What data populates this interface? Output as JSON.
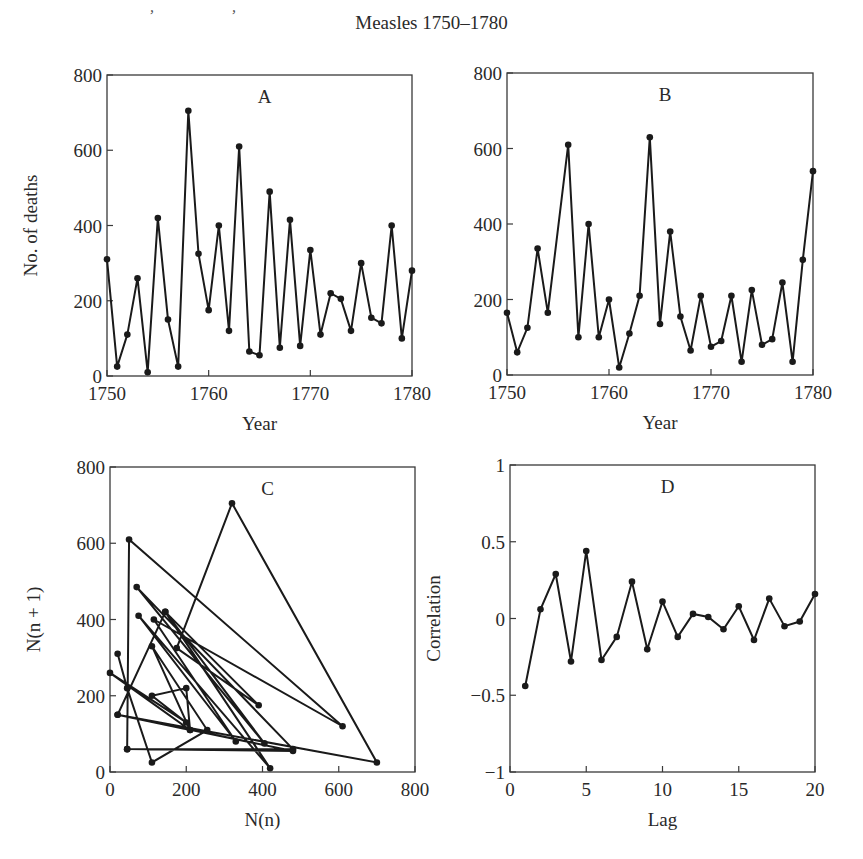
{
  "page": {
    "header_fragments": [
      ",",
      "y",
      ","
    ],
    "figure_title": "Measles 1750–1780"
  },
  "chart_data": [
    {
      "panel": "A",
      "type": "line",
      "title": "A",
      "xlabel": "Year",
      "ylabel": "No. of deaths",
      "xlim": [
        1750,
        1780
      ],
      "ylim": [
        0,
        800
      ],
      "xticks": [
        1750,
        1760,
        1770,
        1780
      ],
      "yticks": [
        0,
        200,
        400,
        600,
        800
      ],
      "x": [
        1750,
        1751,
        1752,
        1753,
        1754,
        1755,
        1756,
        1757,
        1758,
        1759,
        1760,
        1761,
        1762,
        1763,
        1764,
        1765,
        1766,
        1767,
        1768,
        1769,
        1770,
        1771,
        1772,
        1773,
        1774,
        1775,
        1776,
        1777,
        1778,
        1779,
        1780
      ],
      "values": [
        310,
        25,
        110,
        260,
        10,
        420,
        150,
        25,
        705,
        325,
        175,
        400,
        120,
        610,
        65,
        55,
        490,
        75,
        415,
        80,
        335,
        110,
        220,
        205,
        120,
        300,
        155,
        140,
        400,
        100,
        280
      ],
      "markers": true,
      "grid": false
    },
    {
      "panel": "B",
      "type": "line",
      "title": "B",
      "xlabel": "Year",
      "ylabel": "",
      "xlim": [
        1750,
        1780
      ],
      "ylim": [
        0,
        800
      ],
      "xticks": [
        1750,
        1760,
        1770,
        1780
      ],
      "yticks": [
        0,
        200,
        400,
        600,
        800
      ],
      "x": [
        1750,
        1751,
        1752,
        1753,
        1754,
        1756,
        1757,
        1758,
        1759,
        1760,
        1761,
        1762,
        1763,
        1764,
        1765,
        1766,
        1767,
        1768,
        1769,
        1770,
        1771,
        1772,
        1773,
        1774,
        1775,
        1776,
        1777,
        1778,
        1779,
        1780
      ],
      "values": [
        165,
        60,
        125,
        335,
        165,
        610,
        100,
        400,
        100,
        200,
        20,
        110,
        210,
        630,
        135,
        380,
        155,
        65,
        210,
        75,
        90,
        210,
        35,
        225,
        80,
        95,
        245,
        35,
        305,
        540
      ],
      "markers": true,
      "grid": false
    },
    {
      "panel": "C",
      "type": "line",
      "title": "C",
      "xlabel": "N(n)",
      "ylabel": "N(n + 1)",
      "xlim": [
        0,
        800
      ],
      "ylim": [
        0,
        800
      ],
      "xticks": [
        0,
        200,
        400,
        600,
        800
      ],
      "yticks": [
        0,
        200,
        400,
        600,
        800
      ],
      "points": [
        [
          20,
          310
        ],
        [
          45,
          220
        ],
        [
          110,
          25
        ],
        [
          255,
          110
        ],
        [
          110,
          330
        ],
        [
          210,
          110
        ],
        [
          0,
          260
        ],
        [
          200,
          130
        ],
        [
          110,
          200
        ],
        [
          200,
          220
        ],
        [
          210,
          110
        ],
        [
          20,
          150
        ],
        [
          145,
          420
        ],
        [
          390,
          175
        ],
        [
          175,
          325
        ],
        [
          320,
          705
        ],
        [
          700,
          25
        ],
        [
          20,
          150
        ],
        [
          480,
          55
        ],
        [
          45,
          60
        ],
        [
          50,
          610
        ],
        [
          610,
          120
        ],
        [
          115,
          400
        ],
        [
          330,
          80
        ],
        [
          75,
          410
        ],
        [
          420,
          10
        ],
        [
          145,
          420
        ],
        [
          405,
          75
        ],
        [
          70,
          485
        ],
        [
          480,
          60
        ],
        [
          45,
          60
        ]
      ],
      "markers": true,
      "grid": false
    },
    {
      "panel": "D",
      "type": "line",
      "title": "D",
      "xlabel": "Lag",
      "ylabel": "Correlation",
      "xlim": [
        0,
        20
      ],
      "ylim": [
        -1,
        1
      ],
      "xticks": [
        0,
        5,
        10,
        15,
        20
      ],
      "yticks": [
        -1,
        -0.5,
        0,
        0.5,
        1
      ],
      "ytick_labels": [
        "−1",
        "−0.5",
        "0",
        "0.5",
        "1"
      ],
      "x": [
        1,
        2,
        3,
        4,
        5,
        6,
        7,
        8,
        9,
        10,
        11,
        12,
        13,
        14,
        15,
        16,
        17,
        18,
        19,
        20
      ],
      "values": [
        -0.44,
        0.06,
        0.29,
        -0.28,
        0.44,
        -0.27,
        -0.12,
        0.24,
        -0.2,
        0.11,
        -0.12,
        0.03,
        0.01,
        -0.07,
        0.08,
        -0.14,
        0.13,
        -0.05,
        -0.02,
        0.16
      ],
      "markers": true,
      "grid": false
    }
  ]
}
